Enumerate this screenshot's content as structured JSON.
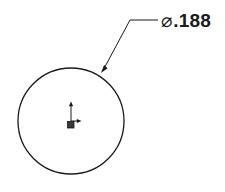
{
  "view": {
    "background_color": "#ffffff",
    "line_color": "#1a1a1a",
    "width": 225,
    "height": 192
  },
  "geometry": {
    "circle": {
      "name": "hole-circle",
      "center_x": 71,
      "center_y": 121,
      "radius": 53,
      "stroke_width": 1.3,
      "color": "#1a1a1a"
    },
    "origin_marker": {
      "name": "origin-triad",
      "x": 71,
      "y": 121,
      "x_axis_label": "X",
      "y_axis_label": "Y",
      "color": "#1a1a1a"
    }
  },
  "annotation": {
    "leader": {
      "name": "leader-line",
      "arrow_tip_x": 101,
      "arrow_tip_y": 73,
      "elbow_x": 130,
      "elbow_y": 20,
      "landing_end_x": 158,
      "landing_end_y": 20,
      "color": "#1a1a1a"
    },
    "dimension": {
      "symbol": "⌀",
      "symbol_name": "diameter-symbol",
      "value": ".188",
      "full_text": "⌀.188"
    }
  }
}
